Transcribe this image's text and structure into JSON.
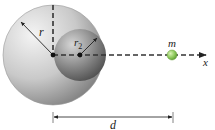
{
  "diagram": {
    "type": "physics-gravitation-hollow-sphere",
    "labels": {
      "big_radius": "r",
      "small_radius": "r",
      "small_radius_subscript": "2",
      "mass": "m",
      "axis": "x",
      "distance": "d"
    },
    "colors": {
      "big_sphere_light": "#f2f2f2",
      "big_sphere_dark": "#8c8c8c",
      "cavity_light": "#c8c8c8",
      "cavity_dark": "#4a4a4a",
      "mass_ball": "#8fcf5a",
      "dashed_line": "#333333"
    }
  }
}
